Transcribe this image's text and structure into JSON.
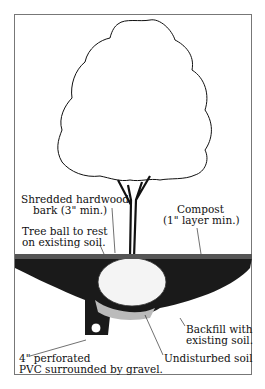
{
  "diagram": {
    "type": "tree planting cross-section",
    "labels": {
      "bark": [
        "Shredded hardwood",
        "bark (3\" min.)"
      ],
      "compost": [
        "Compost",
        "(1\" layer min.)"
      ],
      "tree_ball": [
        "Tree ball to rest",
        "on existing soil."
      ],
      "backfill": [
        "Backfill with",
        "existing soil."
      ],
      "pvc": [
        "4\" perforated",
        "PVC surrounded by gravel."
      ],
      "undisturbed": [
        "Undisturbed soil"
      ]
    },
    "colors": {
      "ink": "#111111",
      "border": "#777777",
      "background": "#ffffff"
    }
  }
}
